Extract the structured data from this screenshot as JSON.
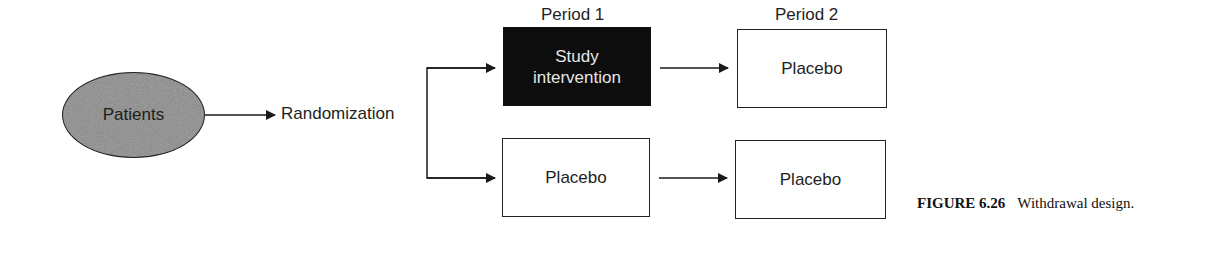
{
  "diagram": {
    "source_node": {
      "label": "Patients",
      "fill": "#8a8a8a"
    },
    "randomization": {
      "label": "Randomization"
    },
    "periods": [
      {
        "label": "Period 1"
      },
      {
        "label": "Period 2"
      }
    ],
    "arms": [
      {
        "period1": {
          "label": "Study intervention",
          "lines": [
            "Study",
            "intervention"
          ],
          "fill": "#0d0d0d"
        },
        "period2": {
          "label": "Placebo",
          "fill": "#ffffff"
        }
      },
      {
        "period1": {
          "label": "Placebo",
          "fill": "#ffffff"
        },
        "period2": {
          "label": "Placebo",
          "fill": "#ffffff"
        }
      }
    ]
  },
  "caption": {
    "number": "FIGURE 6.26",
    "text": "Withdrawal design."
  }
}
